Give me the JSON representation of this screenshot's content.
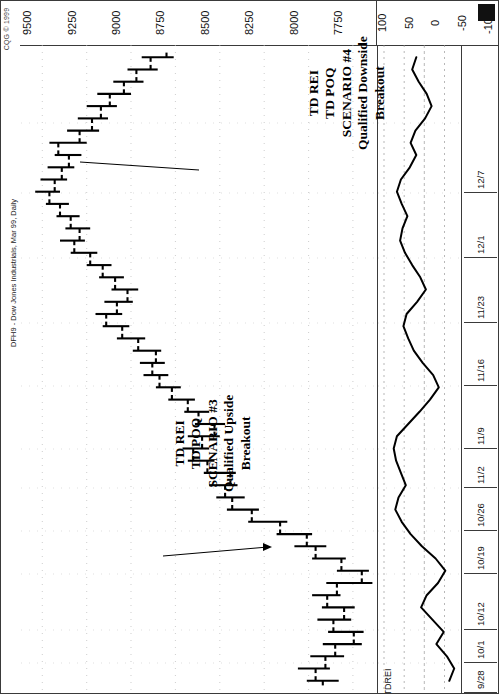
{
  "window": {
    "copyright": "CQG © 1999",
    "instrument_title": "DFH9 - Dow Jones Industrials, Mar 99, Daily"
  },
  "price_scale": {
    "labels": [
      "9500",
      "9250",
      "9000",
      "8750",
      "8500",
      "8250",
      "8000",
      "7750"
    ]
  },
  "indicator_scale": {
    "name": "TDREI",
    "labels": [
      "100",
      "50",
      "0",
      "-50",
      "-100"
    ]
  },
  "date_axis": {
    "labels": [
      "12/7",
      "12/1",
      "11/23",
      "11/16",
      "11/9",
      "11/2",
      "10/26",
      "10/19",
      "10/12",
      "10/1",
      "9/28"
    ]
  },
  "annotations": [
    {
      "id": "scenario-4",
      "lines": [
        "TD REI",
        "TD POQ",
        "SCENARIO #4",
        "Qualified Downside",
        "Breakout"
      ]
    },
    {
      "id": "scenario-3",
      "lines": [
        "TD REI",
        "TD POQ",
        "SCENARIO #3",
        "Qualified Upside",
        "Breakout"
      ]
    }
  ],
  "colors": {
    "ink": "#000000",
    "frame": "#3a3a3a",
    "grid": "#b9b9b9",
    "background": "#ffffff"
  },
  "chart_data": {
    "type": "bar",
    "title": "DFH9 - Dow Jones Industrials, Mar 99, Daily",
    "subtitle": "CQG © 1999",
    "orientation": "rotated-90",
    "xlabel": "Date",
    "ylabel": "Price",
    "grid": true,
    "ylim": [
      7620,
      9620
    ],
    "price_ticks": [
      9500,
      9250,
      9000,
      8750,
      8500,
      8250,
      8000,
      7750
    ],
    "x_tick_labels": [
      "9/28",
      "10/1",
      "10/12",
      "10/19",
      "10/26",
      "11/2",
      "11/9",
      "11/16",
      "11/23",
      "12/1",
      "12/7"
    ],
    "series": [
      {
        "name": "DFH9 OHLC bars",
        "type": "ohlc",
        "bars": [
          {
            "date": "9/28",
            "open": 7920,
            "high": 8010,
            "low": 7830,
            "close": 7960
          },
          {
            "date": "9/29",
            "open": 7960,
            "high": 8060,
            "low": 7880,
            "close": 7905
          },
          {
            "date": "9/30",
            "open": 7905,
            "high": 7990,
            "low": 7800,
            "close": 7850
          },
          {
            "date": "10/1",
            "open": 7850,
            "high": 7920,
            "low": 7700,
            "close": 7745
          },
          {
            "date": "10/2",
            "open": 7745,
            "high": 7890,
            "low": 7690,
            "close": 7860
          },
          {
            "date": "10/5",
            "open": 7860,
            "high": 7950,
            "low": 7760,
            "close": 7800
          },
          {
            "date": "10/6",
            "open": 7800,
            "high": 7925,
            "low": 7740,
            "close": 7895
          },
          {
            "date": "10/7",
            "open": 7895,
            "high": 7980,
            "low": 7820,
            "close": 7840
          },
          {
            "date": "10/8",
            "open": 7840,
            "high": 7900,
            "low": 7640,
            "close": 7700
          },
          {
            "date": "10/9",
            "open": 7700,
            "high": 7840,
            "low": 7660,
            "close": 7815
          },
          {
            "date": "10/12",
            "open": 7815,
            "high": 7980,
            "low": 7790,
            "close": 7960
          },
          {
            "date": "10/13",
            "open": 7960,
            "high": 8080,
            "low": 7900,
            "close": 8010
          },
          {
            "date": "10/14",
            "open": 8010,
            "high": 8180,
            "low": 7980,
            "close": 8160
          },
          {
            "date": "10/15",
            "open": 8160,
            "high": 8340,
            "low": 8120,
            "close": 8320
          },
          {
            "date": "10/16",
            "open": 8320,
            "high": 8460,
            "low": 8280,
            "close": 8430
          },
          {
            "date": "10/19",
            "open": 8430,
            "high": 8520,
            "low": 8360,
            "close": 8470
          },
          {
            "date": "10/20",
            "open": 8470,
            "high": 8560,
            "low": 8400,
            "close": 8440
          },
          {
            "date": "10/21",
            "open": 8440,
            "high": 8590,
            "low": 8410,
            "close": 8570
          },
          {
            "date": "10/22",
            "open": 8570,
            "high": 8680,
            "low": 8530,
            "close": 8650
          },
          {
            "date": "10/23",
            "open": 8650,
            "high": 8710,
            "low": 8560,
            "close": 8600
          },
          {
            "date": "10/26",
            "open": 8600,
            "high": 8680,
            "low": 8500,
            "close": 8530
          },
          {
            "date": "10/27",
            "open": 8530,
            "high": 8640,
            "low": 8470,
            "close": 8620
          },
          {
            "date": "10/28",
            "open": 8620,
            "high": 8700,
            "low": 8560,
            "close": 8680
          },
          {
            "date": "10/29",
            "open": 8680,
            "high": 8790,
            "low": 8640,
            "close": 8770
          },
          {
            "date": "10/30",
            "open": 8770,
            "high": 8860,
            "low": 8720,
            "close": 8840
          },
          {
            "date": "11/2",
            "open": 8840,
            "high": 8930,
            "low": 8790,
            "close": 8880
          },
          {
            "date": "11/3",
            "open": 8880,
            "high": 8950,
            "low": 8810,
            "close": 8860
          },
          {
            "date": "11/4",
            "open": 8860,
            "high": 8990,
            "low": 8830,
            "close": 8960
          },
          {
            "date": "11/5",
            "open": 8960,
            "high": 9080,
            "low": 8920,
            "close": 9050
          },
          {
            "date": "11/6",
            "open": 9050,
            "high": 9160,
            "low": 9010,
            "close": 9140
          },
          {
            "date": "11/9",
            "open": 9140,
            "high": 9200,
            "low": 9050,
            "close": 9080
          },
          {
            "date": "11/10",
            "open": 9080,
            "high": 9150,
            "low": 8990,
            "close": 9020
          },
          {
            "date": "11/11",
            "open": 9020,
            "high": 9110,
            "low": 8960,
            "close": 9090
          },
          {
            "date": "11/12",
            "open": 9090,
            "high": 9180,
            "low": 9040,
            "close": 9160
          },
          {
            "date": "11/13",
            "open": 9160,
            "high": 9250,
            "low": 9110,
            "close": 9230
          },
          {
            "date": "11/16",
            "open": 9230,
            "high": 9340,
            "low": 9190,
            "close": 9320
          },
          {
            "date": "11/17",
            "open": 9320,
            "high": 9400,
            "low": 9260,
            "close": 9290
          },
          {
            "date": "11/18",
            "open": 9290,
            "high": 9370,
            "low": 9230,
            "close": 9340
          },
          {
            "date": "11/19",
            "open": 9340,
            "high": 9420,
            "low": 9290,
            "close": 9400
          },
          {
            "date": "11/20",
            "open": 9400,
            "high": 9480,
            "low": 9350,
            "close": 9460
          },
          {
            "date": "11/23",
            "open": 9460,
            "high": 9540,
            "low": 9400,
            "close": 9430
          },
          {
            "date": "11/24",
            "open": 9430,
            "high": 9510,
            "low": 9360,
            "close": 9390
          },
          {
            "date": "11/25",
            "open": 9390,
            "high": 9470,
            "low": 9320,
            "close": 9350
          },
          {
            "date": "11/27",
            "open": 9350,
            "high": 9430,
            "low": 9280,
            "close": 9410
          },
          {
            "date": "11/30",
            "open": 9410,
            "high": 9460,
            "low": 9250,
            "close": 9290
          },
          {
            "date": "12/1",
            "open": 9290,
            "high": 9360,
            "low": 9180,
            "close": 9220
          },
          {
            "date": "12/2",
            "open": 9220,
            "high": 9300,
            "low": 9130,
            "close": 9170
          },
          {
            "date": "12/3",
            "open": 9170,
            "high": 9250,
            "low": 9080,
            "close": 9120
          },
          {
            "date": "12/4",
            "open": 9120,
            "high": 9190,
            "low": 9000,
            "close": 9040
          },
          {
            "date": "12/7",
            "open": 9040,
            "high": 9100,
            "low": 8930,
            "close": 8970
          },
          {
            "date": "12/8",
            "open": 8970,
            "high": 9020,
            "low": 8850,
            "close": 8890
          },
          {
            "date": "12/9",
            "open": 8890,
            "high": 8940,
            "low": 8760,
            "close": 8800
          }
        ]
      },
      {
        "name": "TDREI",
        "type": "line",
        "ylim": [
          -100,
          100
        ],
        "ticks": [
          100,
          50,
          0,
          -50,
          -100
        ],
        "values": [
          -62,
          -74,
          -56,
          -30,
          -48,
          -20,
          8,
          -6,
          -34,
          -52,
          -28,
          6,
          34,
          56,
          72,
          64,
          46,
          58,
          70,
          76,
          68,
          40,
          12,
          -14,
          -36,
          -22,
          4,
          26,
          40,
          52,
          44,
          18,
          -4,
          10,
          30,
          48,
          60,
          54,
          42,
          56,
          68,
          58,
          36,
          20,
          34,
          22,
          -2,
          -18,
          -6,
          14,
          30,
          20
        ]
      }
    ]
  }
}
